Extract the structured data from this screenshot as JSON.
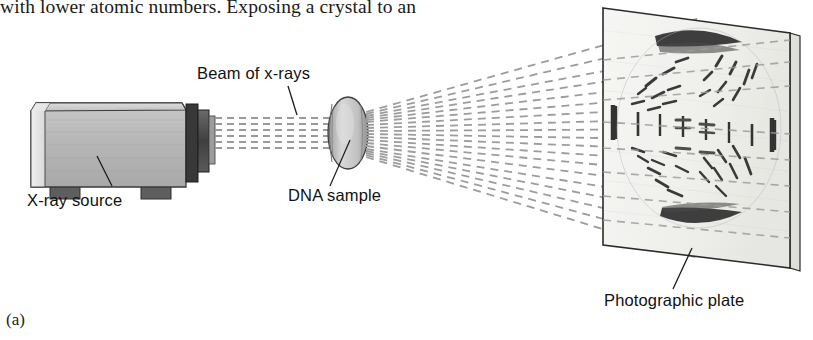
{
  "figure": {
    "body_text_above": "with lower atomic numbers. Exposing a crystal to an",
    "caption": "(a)",
    "labels": {
      "beam": "Beam of x-rays",
      "source": "X-ray source",
      "sample": "DNA sample",
      "plate": "Photographic plate"
    }
  },
  "colors": {
    "ink": "#111111",
    "body_ink": "#1a1a1a",
    "ray": "#9a9a9a",
    "plate_face": "#f2f2f0",
    "plate_edge": "#2b2b2b",
    "source_body": "#b9b9b9",
    "source_top": "#cfcfcf",
    "source_left": "#e4e4e4",
    "nozzle": "#4a4a4a",
    "foot": "#5c5c5c",
    "pattern_dark": "#2e2e2e",
    "pattern_mid": "#5a5a5a"
  },
  "geometry": {
    "canvas": {
      "width": 813,
      "height": 340
    },
    "source_box": {
      "x": 14,
      "y": 100,
      "width": 175,
      "height": 90
    },
    "sample_disc": {
      "cx": 348,
      "cy": 133,
      "rx": 20,
      "ry": 36
    },
    "plate_quad": {
      "tl_x": 603,
      "tl_y": 8,
      "tr_x": 790,
      "tr_y": 33,
      "br_x": 790,
      "br_y": 268,
      "bl_x": 603,
      "bl_y": 245
    },
    "incident_beam_lines": 6,
    "diffracted_ray_count": 19
  }
}
